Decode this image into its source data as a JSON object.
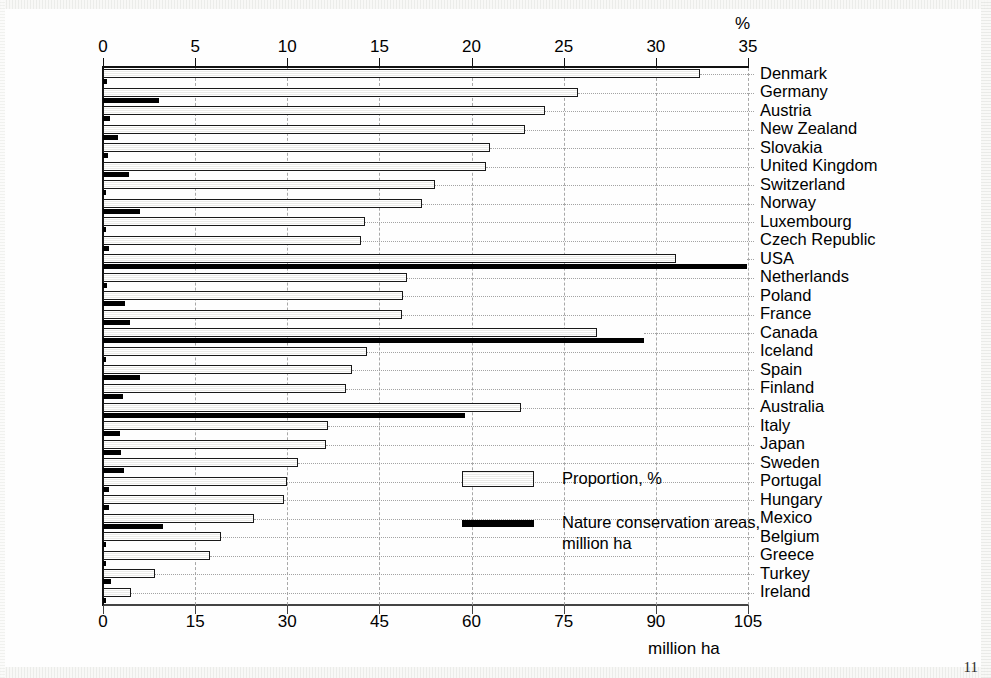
{
  "chart_data": {
    "type": "bar",
    "orientation": "horizontal",
    "title": "",
    "subtitle": "",
    "xlabel_top": "%",
    "xlabel_bottom": "million ha",
    "ylabel": "",
    "grid": true,
    "legend_position": "inside-center-right",
    "top_axis": {
      "label": "%",
      "min": 0,
      "max": 35,
      "ticks": [
        0,
        5,
        10,
        15,
        20,
        25,
        30,
        35
      ],
      "tick_labels": [
        "0",
        "5",
        "10",
        "15",
        "20",
        "25",
        "30",
        "35"
      ]
    },
    "bottom_axis": {
      "label": "million ha",
      "min": 0,
      "max": 105,
      "ticks": [
        0,
        15,
        30,
        45,
        60,
        75,
        90,
        105
      ],
      "tick_labels": [
        "0",
        "15",
        "30",
        "45",
        "60",
        "75",
        "90",
        "105"
      ]
    },
    "categories": [
      "Denmark",
      "Germany",
      "Austria",
      "New Zealand",
      "Slovakia",
      "United Kingdom",
      "Switzerland",
      "Norway",
      "Luxembourg",
      "Czech Republic",
      "USA",
      "Netherlands",
      "Poland",
      "France",
      "Canada",
      "Iceland",
      "Spain",
      "Finland",
      "Australia",
      "Italy",
      "Japan",
      "Sweden",
      "Portugal",
      "Hungary",
      "Mexico",
      "Belgium",
      "Greece",
      "Turkey",
      "Ireland"
    ],
    "series": [
      {
        "name": "Proportion, %",
        "unit": "%",
        "axis": "top",
        "style": "hatched-outline-bar",
        "values": [
          32.4,
          25.8,
          24.0,
          22.9,
          21.0,
          20.8,
          18.0,
          17.3,
          14.2,
          14.0,
          31.1,
          16.5,
          16.3,
          16.2,
          26.8,
          14.3,
          13.5,
          13.2,
          22.7,
          12.2,
          12.1,
          10.6,
          10.0,
          9.8,
          8.2,
          6.4,
          5.8,
          2.8,
          1.5
        ]
      },
      {
        "name": "Nature conservation areas, million ha",
        "unit": "million ha",
        "axis": "bottom",
        "style": "solid-black-bar",
        "values": [
          0.6,
          9.1,
          1.2,
          2.5,
          0.8,
          4.3,
          0.5,
          6.0,
          0.1,
          1.0,
          104.8,
          0.6,
          3.6,
          4.4,
          88.0,
          0.5,
          6.1,
          3.2,
          58.9,
          2.8,
          3.0,
          3.4,
          0.9,
          0.9,
          9.8,
          0.1,
          0.5,
          1.3,
          0.1
        ]
      }
    ],
    "legend": [
      {
        "label": "Proportion, %",
        "swatch": "hatched-outline-bar"
      },
      {
        "label": "Nature conservation areas,\nmillion ha",
        "swatch": "solid-black-bar"
      }
    ]
  },
  "page": {
    "number": "11"
  }
}
